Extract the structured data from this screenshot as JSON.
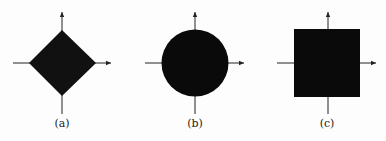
{
  "figure": {
    "panels": [
      {
        "id": "a",
        "label": "(a)",
        "shape": "diamond",
        "cx": 62,
        "cy": 63,
        "half_size": 33
      },
      {
        "id": "b",
        "label": "(b)",
        "shape": "circle",
        "cx": 195,
        "cy": 63,
        "half_size": 33
      },
      {
        "id": "c",
        "label": "(c)",
        "shape": "square",
        "cx": 327,
        "cy": 63,
        "half_size": 33
      }
    ],
    "fill_color": "#111111",
    "axis_color": "#222222"
  }
}
